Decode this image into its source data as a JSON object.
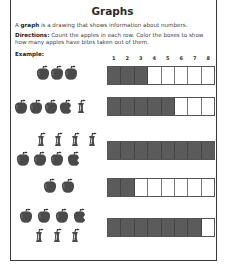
{
  "worksheet": {
    "title": "Graphs",
    "intro_bold": "graph",
    "intro_prefix": "A ",
    "intro_suffix": " is a drawing that shows information about numbers.",
    "directions_label": "Directions:",
    "directions_text": " Count the apples in each row. Color the boxes to show how many apples have bites taken out of them.",
    "example_label": "Example:",
    "column_numbers": [
      "1",
      "2",
      "3",
      "4",
      "5",
      "6",
      "7",
      "8"
    ],
    "fill_color": "#5b5b5b",
    "rows": [
      {
        "name": "example",
        "apples": [
          "whole",
          "whole",
          "whole"
        ],
        "filled": 3,
        "total_boxes": 8
      },
      {
        "name": "row-1",
        "apples": [
          "whole",
          "whole",
          "whole",
          "bitten",
          "core"
        ],
        "filled": 5,
        "total_boxes": 8
      },
      {
        "name": "row-2",
        "apples": [
          "core",
          "core",
          "core",
          "core",
          "whole",
          "whole",
          "whole",
          "bitten"
        ],
        "filled": 8,
        "total_boxes": 8
      },
      {
        "name": "row-3",
        "apples": [
          "whole",
          "whole"
        ],
        "filled": 2,
        "total_boxes": 8
      },
      {
        "name": "row-4",
        "apples": [
          "whole",
          "whole",
          "whole",
          "bitten",
          "core",
          "core",
          "core"
        ],
        "filled": 7,
        "total_boxes": 8
      }
    ]
  }
}
